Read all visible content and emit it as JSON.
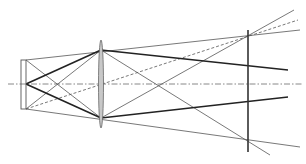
{
  "diagram": {
    "type": "optical-ray-diagram",
    "colors": {
      "background": "#ffffff",
      "ray_thin": "#555555",
      "ray_thick": "#222222",
      "axis": "#888888",
      "lens_fill": "#c8c8c8",
      "lens_stroke": "#666666",
      "screen": "#333333"
    },
    "optical_axis": {
      "x1": 8,
      "y1": 84,
      "x2": 302,
      "y2": 84
    },
    "object": {
      "x": 21,
      "y": 60,
      "width": 5,
      "height": 49
    },
    "lens": {
      "cx": 101,
      "cy": 84,
      "rx": 2.5,
      "ry": 44
    },
    "screen": {
      "x": 248,
      "y1": 30,
      "y2": 152
    },
    "rays_thin": [
      {
        "x1": 26,
        "y1": 60,
        "x2": 300,
        "y2": 30
      },
      {
        "x1": 26,
        "y1": 109,
        "x2": 300,
        "y2": 147
      },
      {
        "x1": 26,
        "y1": 60,
        "x2": 101,
        "y2": 118
      },
      {
        "x1": 26,
        "y1": 109,
        "x2": 101,
        "y2": 50
      },
      {
        "x1": 101,
        "y1": 50,
        "x2": 270,
        "y2": 155
      },
      {
        "x1": 101,
        "y1": 118,
        "x2": 294,
        "y2": 10
      }
    ],
    "rays_thick": [
      {
        "x1": 26,
        "y1": 84,
        "x2": 101,
        "y2": 50
      },
      {
        "x1": 26,
        "y1": 84,
        "x2": 101,
        "y2": 118
      },
      {
        "x1": 101,
        "y1": 50,
        "x2": 288,
        "y2": 70
      },
      {
        "x1": 101,
        "y1": 118,
        "x2": 288,
        "y2": 97
      }
    ],
    "rays_dashed": [
      {
        "x1": 26,
        "y1": 109,
        "x2": 298,
        "y2": 20
      }
    ]
  }
}
